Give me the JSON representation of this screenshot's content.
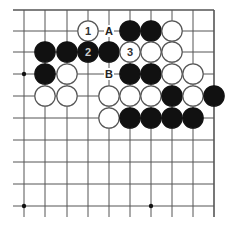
{
  "diagram": {
    "type": "go-board-fragment",
    "corner": "top-right",
    "columns_x": [
      24,
      45,
      67,
      88,
      109,
      130,
      151,
      172,
      193,
      214
    ],
    "rows_y": [
      10,
      31,
      52,
      74,
      96,
      118,
      140,
      162,
      184,
      206
    ],
    "star_points": [
      [
        0,
        3
      ],
      [
        0,
        9
      ],
      [
        6,
        9
      ]
    ],
    "colors": {
      "line": "#555555",
      "black": "#111111",
      "white": "#ffffff",
      "white_stroke": "#555555",
      "label": "#222222"
    },
    "stones": [
      {
        "col": 3,
        "row": 1,
        "color": "white",
        "label": "1"
      },
      {
        "col": 5,
        "row": 1,
        "color": "black",
        "label": ""
      },
      {
        "col": 6,
        "row": 1,
        "color": "black",
        "label": ""
      },
      {
        "col": 7,
        "row": 1,
        "color": "white",
        "label": ""
      },
      {
        "col": 1,
        "row": 2,
        "color": "black",
        "label": ""
      },
      {
        "col": 2,
        "row": 2,
        "color": "black",
        "label": ""
      },
      {
        "col": 3,
        "row": 2,
        "color": "black",
        "label": "2"
      },
      {
        "col": 4,
        "row": 2,
        "color": "black",
        "label": ""
      },
      {
        "col": 5,
        "row": 2,
        "color": "white",
        "label": "3"
      },
      {
        "col": 6,
        "row": 2,
        "color": "white",
        "label": ""
      },
      {
        "col": 7,
        "row": 2,
        "color": "white",
        "label": ""
      },
      {
        "col": 1,
        "row": 3,
        "color": "black",
        "label": ""
      },
      {
        "col": 2,
        "row": 3,
        "color": "white",
        "label": ""
      },
      {
        "col": 5,
        "row": 3,
        "color": "black",
        "label": ""
      },
      {
        "col": 6,
        "row": 3,
        "color": "black",
        "label": ""
      },
      {
        "col": 7,
        "row": 3,
        "color": "white",
        "label": ""
      },
      {
        "col": 8,
        "row": 3,
        "color": "white",
        "label": ""
      },
      {
        "col": 1,
        "row": 4,
        "color": "white",
        "label": ""
      },
      {
        "col": 2,
        "row": 4,
        "color": "white",
        "label": ""
      },
      {
        "col": 4,
        "row": 4,
        "color": "white",
        "label": ""
      },
      {
        "col": 5,
        "row": 4,
        "color": "white",
        "label": ""
      },
      {
        "col": 6,
        "row": 4,
        "color": "white",
        "label": ""
      },
      {
        "col": 7,
        "row": 4,
        "color": "black",
        "label": ""
      },
      {
        "col": 8,
        "row": 4,
        "color": "white",
        "label": ""
      },
      {
        "col": 9,
        "row": 4,
        "color": "black",
        "label": ""
      },
      {
        "col": 4,
        "row": 5,
        "color": "white",
        "label": ""
      },
      {
        "col": 5,
        "row": 5,
        "color": "black",
        "label": ""
      },
      {
        "col": 6,
        "row": 5,
        "color": "black",
        "label": ""
      },
      {
        "col": 7,
        "row": 5,
        "color": "black",
        "label": ""
      },
      {
        "col": 8,
        "row": 5,
        "color": "black",
        "label": ""
      }
    ],
    "point_labels": [
      {
        "col": 4,
        "row": 1,
        "text": "A"
      },
      {
        "col": 4,
        "row": 3,
        "text": "B"
      }
    ]
  }
}
